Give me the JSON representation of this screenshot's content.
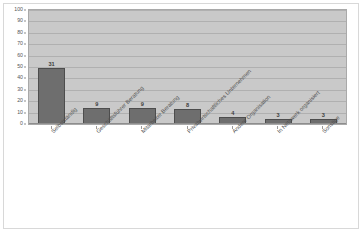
{
  "chart_data": {
    "type": "bar",
    "title": "",
    "xlabel": "",
    "ylabel": "",
    "ylim": [
      0,
      100
    ],
    "yticks": [
      0,
      10,
      20,
      30,
      40,
      50,
      60,
      70,
      80,
      90,
      100
    ],
    "grid": true,
    "legend": "none",
    "categories": [
      "Selbstständig",
      "Geschäftsführer Beratung",
      "Mitarbeiter Beratung",
      "Privatwirtschaftliches Unternehmen",
      "Andere Organisation",
      "In Netzwerk organisiert",
      "Sonstige"
    ],
    "values": [
      31,
      9,
      9,
      8,
      4,
      3,
      3
    ],
    "bar_heights": [
      49,
      14,
      14,
      13,
      6,
      4,
      4
    ],
    "data_labels": [
      "31",
      "9",
      "9",
      "8",
      "4",
      "3",
      "3"
    ],
    "colors": {
      "bar_fill": "#6e6e6e",
      "bar_border": "#4d4d4d",
      "plot_background": "#c9c9c9",
      "gridline": "#b0b0b0",
      "axis": "#8d8d8d",
      "text": "#4f4f4f",
      "page_background": "#ffffff"
    }
  }
}
